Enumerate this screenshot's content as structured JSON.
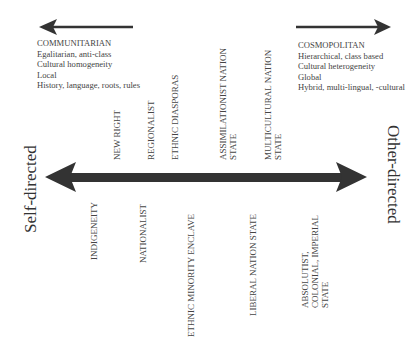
{
  "diagram": {
    "axis": {
      "left_label": "Self-directed",
      "right_label": "Other-directed",
      "arrow_color": "#333333"
    },
    "left_pole": {
      "lines": [
        "COMMUNITARIAN",
        "Egalitarian, anti-class",
        "Cultural homogeneity",
        "Local",
        "History, language, roots, rules"
      ]
    },
    "right_pole": {
      "lines": [
        "COSMOPOLITAN",
        "Hierarchical, class based",
        "Cultural heterogeneity",
        "Global",
        "Hybrid, multi-lingual, -cultural"
      ]
    },
    "upper_labels": [
      {
        "lines": [
          "NEW RIGHT"
        ]
      },
      {
        "lines": [
          "REGIONALIST"
        ]
      },
      {
        "lines": [
          "ETHNIC DIASPORAS"
        ]
      },
      {
        "lines": [
          "ASSIMILATIONIST NATION",
          "STATE"
        ]
      },
      {
        "lines": [
          "MULTICULTURAL NATION",
          "STATE"
        ]
      }
    ],
    "lower_labels": [
      {
        "lines": [
          "INDIGENEITY"
        ]
      },
      {
        "lines": [
          "NATIONALIST"
        ]
      },
      {
        "lines": [
          "ETHNIC MINORITY ENCLAVE"
        ]
      },
      {
        "lines": [
          "LIBERAL NATION STATE"
        ]
      },
      {
        "lines": [
          "ABSOLUTIST,",
          "COLONIAL, IMPERIAL",
          "STATE"
        ]
      }
    ]
  }
}
